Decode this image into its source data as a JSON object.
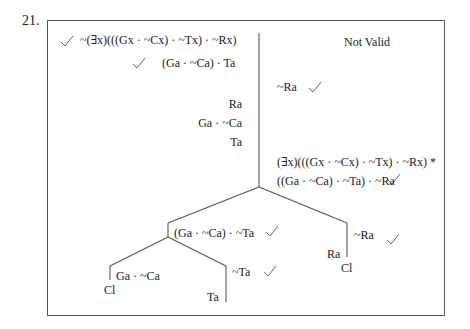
{
  "exercise_number": "21.",
  "verdict": "Not Valid",
  "trunk": {
    "premise": "~(∃x)(((Gx · ~Cx) · ~Tx) · ~Rx)",
    "line2": "(Ga · ~Ca) · Ta",
    "line3": "Ra",
    "line4": "Ga · ~Ca",
    "line5": "Ta",
    "right_neg": "~Ra",
    "right_exist": "(∃x)(((Gx · ~Cx) · ~Tx) · ~Rx) *",
    "right_inst": "((Ga · ~Ca) · ~Ta) · ~Ra"
  },
  "left_branch": {
    "head": "(Ga · ~Ca) · ~Ta",
    "sub_left": {
      "formula": "Ga · ~Ca",
      "closed": "Cl"
    },
    "sub_right": {
      "formula": "~Ta",
      "leaf": "Ta"
    }
  },
  "right_branch": {
    "head": "~Ra",
    "leaf": "Ra",
    "closed": "Cl"
  },
  "check_mark": "✓"
}
